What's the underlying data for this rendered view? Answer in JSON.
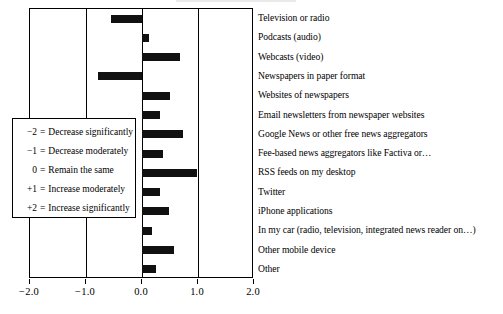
{
  "chart_data": {
    "type": "bar",
    "orientation": "horizontal",
    "title": "",
    "xlabel": "",
    "ylabel": "",
    "xlim": [
      -2.0,
      2.0
    ],
    "grid": true,
    "gridlines": [
      -2.0,
      -1.0,
      0.0,
      1.0,
      2.0
    ],
    "xticks": [
      "−2.0",
      "−1.0",
      "0.0",
      "1.0",
      "2.0"
    ],
    "xtick_values": [
      -2.0,
      -1.0,
      0.0,
      1.0,
      2.0
    ],
    "legend_position": "inside-left",
    "categories": [
      "Television or radio",
      "Podcasts (audio)",
      "Webcasts (video)",
      "Newspapers in paper format",
      "Websites of newspapers",
      "Email newsletters from newspaper websites",
      "Google News or other free news aggregators",
      "Fee-based news aggregators like Factiva or…",
      "RSS feeds on my desktop",
      "Twitter",
      "iPhone applications",
      "In my car (radio, television, integrated news reader on…)",
      "Other mobile device",
      "Other"
    ],
    "values": [
      -0.56,
      0.12,
      0.67,
      -0.79,
      0.5,
      0.32,
      0.73,
      0.37,
      0.99,
      0.33,
      0.49,
      0.17,
      0.58,
      0.25
    ],
    "bar_color": "#111111"
  },
  "legend": {
    "rows": [
      {
        "key": "−2",
        "eq": "=",
        "desc": "Decrease significantly"
      },
      {
        "key": "−1",
        "eq": "=",
        "desc": "Decrease moderately"
      },
      {
        "key": "0",
        "eq": "=",
        "desc": "Remain the same"
      },
      {
        "key": "+1",
        "eq": "=",
        "desc": "Increase moderately"
      },
      {
        "key": "+2",
        "eq": "=",
        "desc": "Increase significantly"
      }
    ]
  }
}
